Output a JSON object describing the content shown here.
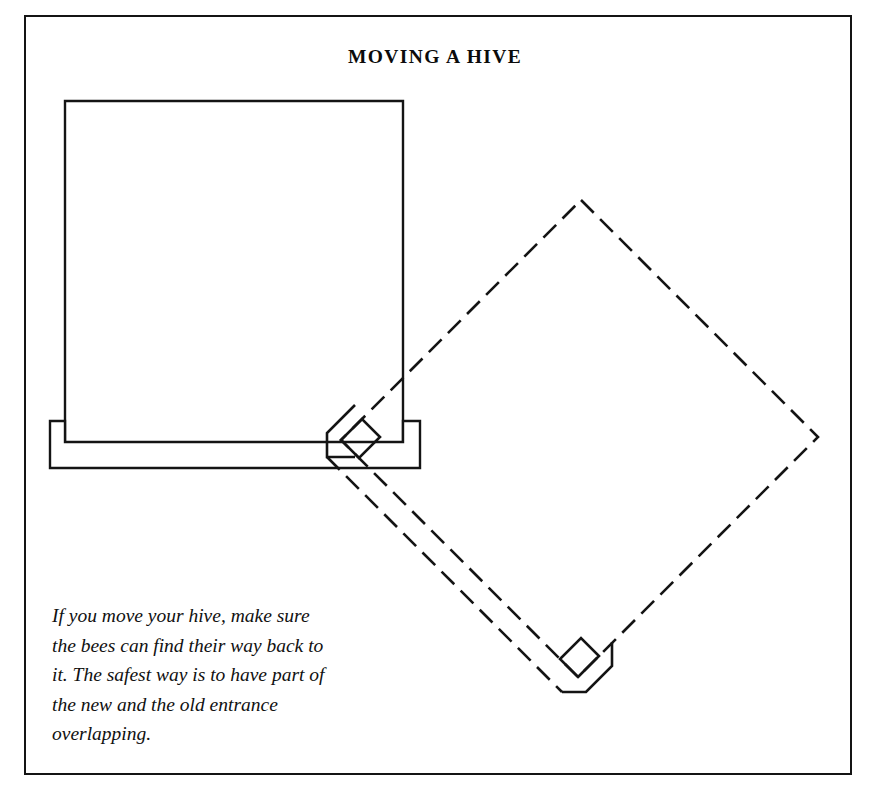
{
  "figure": {
    "title": "MOVING A HIVE",
    "caption": "If you move your hive, make sure\nthe bees can find their way back to\nit. The safest way is to have part of\nthe new and the old entrance\noverlapping.",
    "stroke_color": "#141414",
    "background_color": "#ffffff",
    "frame": {
      "label": "figure-border"
    },
    "old_hive": {
      "label": "old hive position",
      "line_style": "solid",
      "body": {
        "x": 65,
        "y": 101,
        "width": 338,
        "height": 342
      },
      "landing_board": {
        "x": 50,
        "y": 421,
        "width": 370,
        "height": 47
      }
    },
    "new_hive": {
      "label": "new hive position",
      "line_style": "dashed",
      "rotation_degrees": 45,
      "dash_length": 18,
      "dash_gap": 9,
      "vertices": {
        "top": [
          581,
          200
        ],
        "right": [
          818,
          437
        ],
        "bottom": [
          578,
          677
        ],
        "left": [
          341,
          440
        ]
      }
    }
  }
}
